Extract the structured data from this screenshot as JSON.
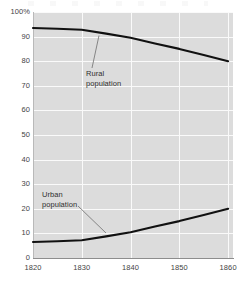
{
  "chart_data": {
    "type": "line",
    "title": "",
    "subtitle": "",
    "xlabel": "",
    "ylabel": "",
    "xlim": [
      1820,
      1861
    ],
    "ylim": [
      0,
      100
    ],
    "grid": true,
    "legend_position": "inline-annotations",
    "x_ticks": [
      "1820",
      "1830",
      "1840",
      "1850",
      "1860"
    ],
    "x_tick_values": [
      1820,
      1830,
      1840,
      1850,
      1860
    ],
    "y_ticks": [
      "0",
      "10",
      "20",
      "30",
      "40",
      "50",
      "60",
      "70",
      "80",
      "90",
      "100%"
    ],
    "y_tick_values": [
      0,
      10,
      20,
      30,
      40,
      50,
      60,
      70,
      80,
      90,
      100
    ],
    "x": [
      1820,
      1825,
      1830,
      1835,
      1840,
      1845,
      1850,
      1855,
      1860
    ],
    "series": [
      {
        "name": "Rural population",
        "annotation": "Rural\npopulation",
        "color": "#111111",
        "values": [
          93.5,
          93.2,
          92.8,
          91.2,
          89.5,
          87.2,
          85.0,
          82.5,
          80.0
        ]
      },
      {
        "name": "Urban population",
        "annotation": "Urban\npopulation",
        "color": "#111111",
        "values": [
          6.5,
          6.8,
          7.2,
          8.8,
          10.5,
          12.8,
          15.0,
          17.5,
          20.0
        ]
      }
    ],
    "colors": {
      "plot_background": "#dcdcdc",
      "gridline": "#fafafa",
      "axis": "#8d8d8d",
      "line": "#111111",
      "text": "#444444",
      "page_background": "#ffffff"
    }
  }
}
